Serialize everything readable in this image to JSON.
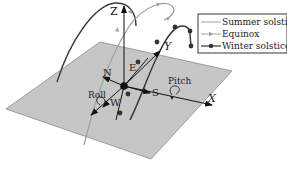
{
  "diagram": {
    "axes": {
      "z": "Z",
      "y": "Y",
      "x": "X"
    },
    "compass": {
      "north": "N",
      "east": "E",
      "south": "S",
      "west": "W"
    },
    "rotations": {
      "roll": "Roll",
      "pitch": "Pitch"
    },
    "legend": {
      "items": [
        {
          "label": "Summer solstice",
          "marker": "none",
          "color": "#9a9a9a"
        },
        {
          "label": "Equinox",
          "marker": "triangle",
          "color": "#9a9a9a"
        },
        {
          "label": "Winter solstice",
          "marker": "circle",
          "color": "#333333"
        }
      ]
    },
    "colors": {
      "plane": "#c6c6c6",
      "plane_edge": "#8a8a8a",
      "summer_path": "#3a3a3a",
      "equinox_path": "#a0a0a0",
      "winter_path": "#333333",
      "axis": "#111111"
    }
  }
}
